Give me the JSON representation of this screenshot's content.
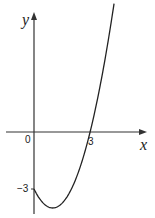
{
  "chart_data": {
    "type": "line",
    "title": "",
    "xlabel": "x",
    "ylabel": "y",
    "function": "y = x^2 - 2x - 3",
    "origin_label": "0",
    "annotations": [
      {
        "label": "3",
        "at": "x-intercept",
        "x": 3,
        "y": 0
      },
      {
        "label": "-3",
        "at": "y-intercept",
        "x": 0,
        "y": -3
      }
    ],
    "x": [
      0,
      0.5,
      1,
      1.5,
      2,
      2.5,
      3,
      3.5,
      4,
      4.3
    ],
    "values": [
      -3,
      -3.75,
      -4,
      -3.75,
      -3,
      -1.75,
      0,
      2.25,
      5,
      6.5
    ],
    "xlim": [
      -1.7,
      6.4
    ],
    "ylim": [
      -4.4,
      6.9
    ],
    "grid": false,
    "legend": "none"
  },
  "labels": {
    "y_axis": "y",
    "x_axis": "x",
    "origin": "0",
    "x_tick": "3",
    "y_tick": "−3"
  }
}
